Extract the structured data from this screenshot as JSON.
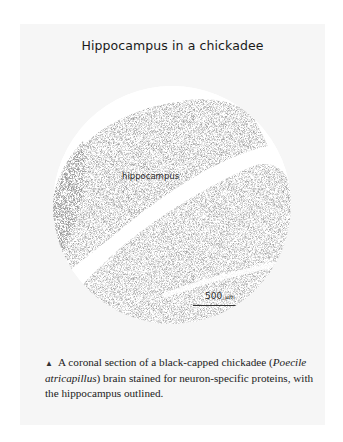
{
  "figure": {
    "title": "Hippocampus in a chickadee",
    "image": {
      "description": "Circular micrograph of brain tissue with stained neurons",
      "region_label": "hippocampus",
      "scale_bar": {
        "value": "500",
        "unit": "µm"
      }
    },
    "caption": {
      "marker": "▲",
      "text_before": " A coronal section of a black-capped chickadee (",
      "species": "Poecile atricapillus",
      "text_after": ") brain stained for neuron-specific proteins, with the hippocampus outlined."
    }
  },
  "colors": {
    "panel_background": "#f6f6f6",
    "page_background": "#ffffff",
    "stain": "#555555"
  }
}
